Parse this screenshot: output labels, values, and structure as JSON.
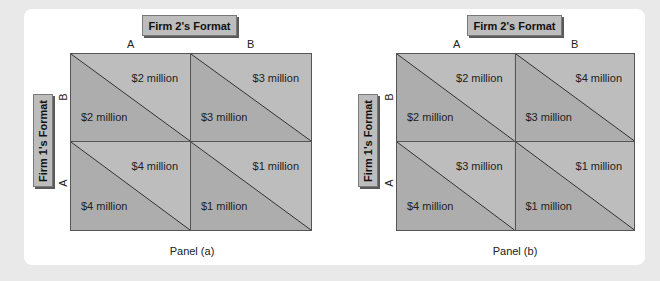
{
  "colors": {
    "page_background": "#e9e9e9",
    "card_background": "#ffffff",
    "upper_triangle": "#bdbdbd",
    "lower_triangle": "#adadad",
    "label_box": "#bdbdbd"
  },
  "panels": [
    {
      "id": "a",
      "column_header": "Firm 2's Format",
      "row_header": "Firm 1's Format",
      "columns": [
        "A",
        "B"
      ],
      "rows": [
        "B",
        "A"
      ],
      "cells": [
        [
          {
            "firm2": "$2 million",
            "firm1": "$2 million"
          },
          {
            "firm2": "$3 million",
            "firm1": "$3 million"
          }
        ],
        [
          {
            "firm2": "$4 million",
            "firm1": "$4 million"
          },
          {
            "firm2": "$1 million",
            "firm1": "$1 million"
          }
        ]
      ],
      "caption": "Panel (a)"
    },
    {
      "id": "b",
      "column_header": "Firm 2's Format",
      "row_header": "Firm 1's Format",
      "columns": [
        "A",
        "B"
      ],
      "rows": [
        "B",
        "A"
      ],
      "cells": [
        [
          {
            "firm2": "$2 million",
            "firm1": "$2 million"
          },
          {
            "firm2": "$4 million",
            "firm1": "$3 million"
          }
        ],
        [
          {
            "firm2": "$3 million",
            "firm1": "$4 million"
          },
          {
            "firm2": "$1 million",
            "firm1": "$1 million"
          }
        ]
      ],
      "caption": "Panel (b)"
    }
  ]
}
